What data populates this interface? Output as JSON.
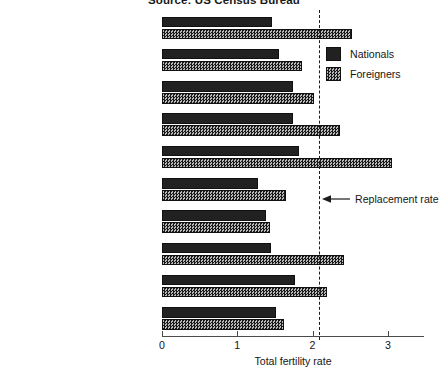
{
  "chart_data": {
    "type": "bar",
    "orientation": "horizontal",
    "title": "Source: US Census Bureau",
    "xlabel": "Total fertility rate",
    "ylabel": "",
    "xlim": [
      0,
      3.48
    ],
    "xticks": [
      0,
      1,
      2,
      3
    ],
    "xtick_labels": [
      "0",
      "1",
      "2",
      "3"
    ],
    "grid": false,
    "legend_position": "upper right",
    "categories": [
      "Austria (1986)",
      "Belgium (1985)",
      "Canada (1986)",
      "England and Wales (1986)",
      "France (1985)",
      "Germany, Fed. Rep. (1985)",
      "Luxembourg (1986)",
      "Netherlands (1985)",
      "Sweden (1986)",
      "Switzerland (1986)"
    ],
    "series": [
      {
        "name": "Nationals",
        "color": "#212121",
        "pattern": "solid",
        "values": [
          1.46,
          1.55,
          1.74,
          1.74,
          1.82,
          1.28,
          1.38,
          1.45,
          1.76,
          1.51
        ]
      },
      {
        "name": "Foreigners",
        "color": "#4d4d4d",
        "pattern": "checkered",
        "values": [
          2.52,
          1.86,
          2.02,
          2.37,
          3.06,
          1.65,
          1.43,
          2.42,
          2.19,
          1.62
        ]
      }
    ],
    "annotations": [
      {
        "name": "replacement-rate",
        "label": "Replacement rate",
        "value": 2.08,
        "style": "dashed-vertical-line-with-arrow"
      }
    ]
  },
  "legend": {
    "entries": [
      {
        "label": "Nationals"
      },
      {
        "label": "Foreigners"
      }
    ]
  }
}
